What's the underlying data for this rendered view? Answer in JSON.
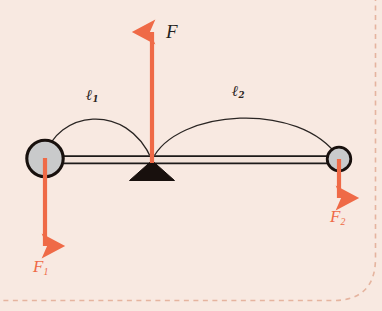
{
  "figure": {
    "type": "physics-free-body-diagram",
    "background_color": "#f8e9e1",
    "accent_color": "#ef6a47",
    "line_color": "#231f20",
    "ball_fill_color": "#c9cacb",
    "page_border": {
      "style": "dashed",
      "color": "#e8b9a6",
      "corner": "rounded-bottom-right"
    }
  },
  "labels": {
    "force_up": "F",
    "force_left": "F",
    "force_left_sub": "1",
    "force_right": "F",
    "force_right_sub": "2",
    "arm_left": "ℓ",
    "arm_left_sub": "1",
    "arm_right": "ℓ",
    "arm_right_sub": "2"
  },
  "elements": {
    "beam": {
      "name": "lever-beam",
      "x1": 45,
      "x2": 340,
      "y": 160
    },
    "fulcrum": {
      "name": "fulcrum-triangle",
      "apex_x": 152,
      "apex_y": 161,
      "base_y": 180,
      "half_width": 22
    },
    "left_mass": {
      "name": "left-mass-ball",
      "cx": 45,
      "cy": 158,
      "r": 18
    },
    "right_mass": {
      "name": "right-mass-ball",
      "cx": 339,
      "cy": 159,
      "r": 12
    },
    "arrow_up": {
      "name": "applied-force-arrow",
      "x": 152,
      "from_y": 162,
      "to_y": 28
    },
    "arrow_left_down": {
      "name": "left-load-arrow",
      "x": 45,
      "from_y": 158,
      "to_y": 251
    },
    "arrow_right_down": {
      "name": "right-load-arrow",
      "x": 339,
      "from_y": 159,
      "to_y": 203
    },
    "arc_left": {
      "name": "lever-arm-left-arc",
      "from_x": 45,
      "to_x": 152,
      "peak_y": 117
    },
    "arc_right": {
      "name": "lever-arm-right-arc",
      "from_x": 152,
      "to_x": 339,
      "peak_y": 110
    }
  }
}
